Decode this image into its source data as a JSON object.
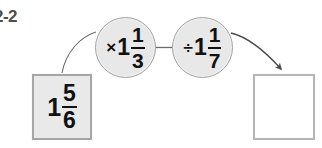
{
  "exercise": {
    "label": "2-2"
  },
  "diagram": {
    "type": "function-machine-flow",
    "colors": {
      "background": "#ffffff",
      "box_fill": "#e9e9e9",
      "box_border": "#a6a6a6",
      "answer_box_fill": "#ffffff",
      "answer_box_border": "#b5b5b5",
      "circle_fill": "#e8e8e8",
      "circle_border": "#a3a3a3",
      "connector_stroke": "#6b6b6b",
      "text": "#111111",
      "label_text": "#4d4d4d"
    },
    "input_box": {
      "name": "start-value",
      "whole": "1",
      "numerator": "5",
      "denominator": "6",
      "text": "1 5/6",
      "empty": false
    },
    "operations": [
      {
        "name": "multiply-operation",
        "sign": "×",
        "sign_name": "multiplication-sign",
        "whole": "1",
        "numerator": "1",
        "denominator": "3",
        "text": "× 1 1/3"
      },
      {
        "name": "divide-operation",
        "sign": "÷",
        "sign_name": "division-sign",
        "whole": "1",
        "numerator": "1",
        "denominator": "7",
        "text": "÷ 1 1/7"
      }
    ],
    "answer_box": {
      "name": "answer-value",
      "value": "",
      "empty": true
    },
    "connectors": [
      {
        "name": "input-to-multiply-connector",
        "style": "curve",
        "arrowhead": false
      },
      {
        "name": "multiply-to-divide-connector",
        "style": "straight",
        "arrowhead": false
      },
      {
        "name": "divide-to-answer-connector",
        "style": "curve",
        "arrowhead": true
      }
    ]
  }
}
